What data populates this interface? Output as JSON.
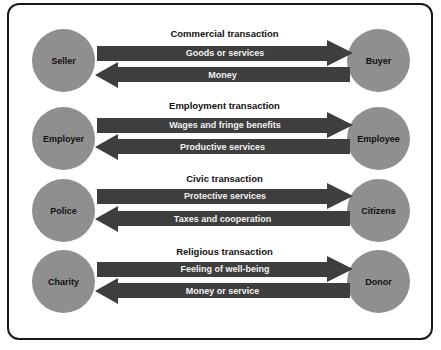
{
  "diagram": {
    "rows": [
      {
        "title": "Commercial transaction",
        "left_party": "Seller",
        "right_party": "Buyer",
        "rightward_flow": "Goods or services",
        "leftward_flow": "Money"
      },
      {
        "title": "Employment transaction",
        "left_party": "Employer",
        "right_party": "Employee",
        "rightward_flow": "Wages and fringe benefits",
        "leftward_flow": "Productive services"
      },
      {
        "title": "Civic transaction",
        "left_party": "Police",
        "right_party": "Citizens",
        "rightward_flow": "Protective services",
        "leftward_flow": "Taxes and cooperation"
      },
      {
        "title": "Religious transaction",
        "left_party": "Charity",
        "right_party": "Donor",
        "rightward_flow": "Feeling of well-being",
        "leftward_flow": "Money or service"
      }
    ],
    "colors": {
      "circle": "#8f8f8f",
      "arrow": "#3e3e3e",
      "arrow_text": "#f2f2f2",
      "frame": "#1a1a1a"
    }
  }
}
